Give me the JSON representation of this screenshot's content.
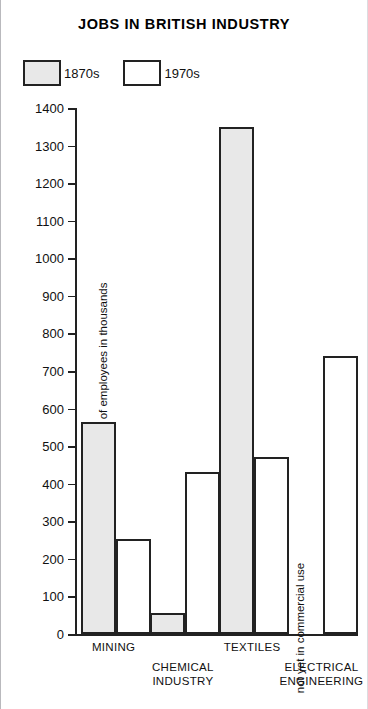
{
  "chart_data": {
    "type": "bar",
    "title": "JOBS IN BRITISH INDUSTRY",
    "xlabel": "",
    "ylabel": "number of employees in thousands",
    "ylim": [
      0,
      1400
    ],
    "ytick_step": 100,
    "yticks": [
      0,
      100,
      200,
      300,
      400,
      500,
      600,
      700,
      800,
      900,
      1000,
      1100,
      1200,
      1300,
      1400
    ],
    "grid": false,
    "legend_position": "top-left",
    "categories": [
      {
        "line1": "MINING",
        "line2": ""
      },
      {
        "line1": "CHEMICAL",
        "line2": "INDUSTRY"
      },
      {
        "line1": "TEXTILES",
        "line2": ""
      },
      {
        "line1": "ELECTRICAL",
        "line2": "ENGINEERING"
      }
    ],
    "series": [
      {
        "name": "1870s",
        "fill": "shaded",
        "values": [
          565,
          55,
          1350,
          null
        ]
      },
      {
        "name": "1970s",
        "fill": "plain",
        "values": [
          252,
          430,
          470,
          740
        ]
      }
    ],
    "annotations": [
      {
        "text": "not yet in commercial use",
        "category": "ELECTRICAL ENGINEERING",
        "series": "1870s",
        "orientation": "vertical"
      }
    ]
  },
  "legend": {
    "items": [
      {
        "label": "1870s",
        "fill": "shaded"
      },
      {
        "label": "1970s",
        "fill": "plain"
      }
    ]
  },
  "colors": {
    "bar_shaded": "#e8e8e8",
    "bar_plain": "#ffffff",
    "outline": "#222222",
    "background": "#ffffff",
    "text": "#111111"
  }
}
